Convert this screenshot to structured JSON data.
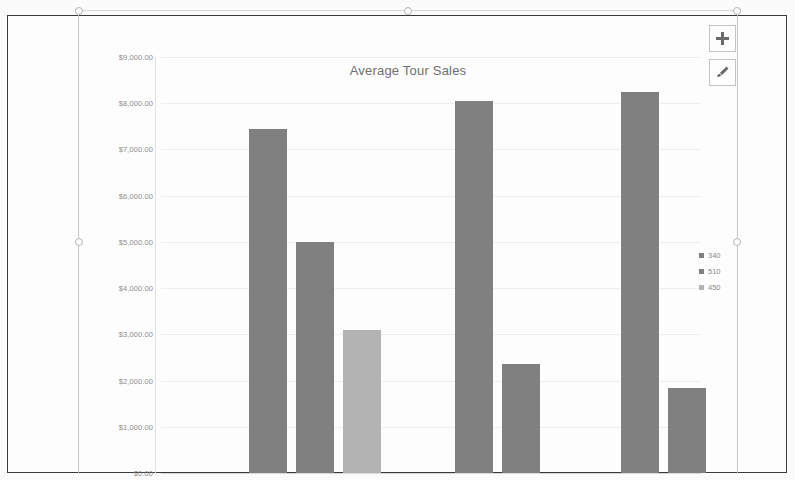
{
  "document": {
    "frame_label": "scanned-document-border"
  },
  "chart_object": {
    "selected": true,
    "handles": [
      "top-left",
      "top-center",
      "top-right",
      "middle-left",
      "middle-right"
    ]
  },
  "buttons": [
    {
      "name": "chart-elements-button",
      "icon": "plus-icon",
      "label": "+"
    },
    {
      "name": "chart-styles-button",
      "icon": "paintbrush-icon",
      "label": ""
    }
  ],
  "legend": {
    "position": "right",
    "entries": [
      {
        "label": "340",
        "color": "#808080"
      },
      {
        "label": "510",
        "color": "#808080"
      },
      {
        "label": "450",
        "color": "#b3b3b3"
      }
    ]
  },
  "chart_data": {
    "type": "bar",
    "title": "Average Tour Sales",
    "xlabel": "",
    "ylabel": "",
    "ylim": [
      0,
      9000
    ],
    "ytick_step": 1000,
    "grid": true,
    "legend_position": "right",
    "ytick_labels": [
      "$9,000.00",
      "$8,000.00",
      "$7,000.00",
      "$6,000.00",
      "$5,000.00",
      "$4,000.00",
      "$3,000.00",
      "$2,000.00",
      "$1,000.00",
      "$0.00"
    ],
    "ytick_values": [
      9000,
      8000,
      7000,
      6000,
      5000,
      4000,
      3000,
      2000,
      1000,
      0
    ],
    "categories": [
      "Group 1",
      "Group 2",
      "Group 3"
    ],
    "series": [
      {
        "name": "340",
        "color": "#808080",
        "values": [
          7450,
          8050,
          8250
        ]
      },
      {
        "name": "510",
        "color": "#808080",
        "values": [
          5000,
          2350,
          1850
        ]
      },
      {
        "name": "450",
        "color": "#b3b3b3",
        "values": [
          3100,
          null,
          null
        ]
      }
    ],
    "bars": [
      {
        "group": 1,
        "series": "340",
        "value": 7450,
        "color": "#808080"
      },
      {
        "group": 1,
        "series": "510",
        "value": 5000,
        "color": "#808080"
      },
      {
        "group": 1,
        "series": "450",
        "value": 3100,
        "color": "#b3b3b3"
      },
      {
        "group": 2,
        "series": "340",
        "value": 8050,
        "color": "#808080"
      },
      {
        "group": 2,
        "series": "510",
        "value": 2350,
        "color": "#808080"
      },
      {
        "group": 3,
        "series": "340",
        "value": 8250,
        "color": "#808080"
      },
      {
        "group": 3,
        "series": "510",
        "value": 1850,
        "color": "#808080"
      }
    ]
  }
}
